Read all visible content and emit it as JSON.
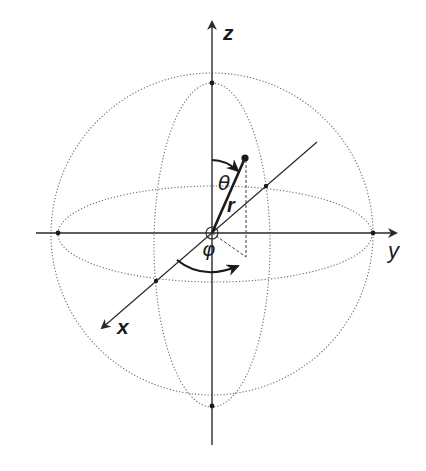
{
  "diagram": {
    "axes": {
      "z": {
        "label": "z"
      },
      "y": {
        "label": "y"
      },
      "x": {
        "label": "x"
      }
    },
    "symbols": {
      "theta": "θ",
      "phi": "φ",
      "r": "r"
    },
    "colors": {
      "line": "#2a2a2a",
      "dotted": "#6a6a6a",
      "background": "#ffffff"
    },
    "geometry": {
      "center": [
        212,
        233
      ],
      "sphere_radius": 160,
      "meridian_rx": 58,
      "equator_ry": 48,
      "point": [
        245,
        158
      ],
      "projection": [
        246,
        257
      ]
    }
  }
}
